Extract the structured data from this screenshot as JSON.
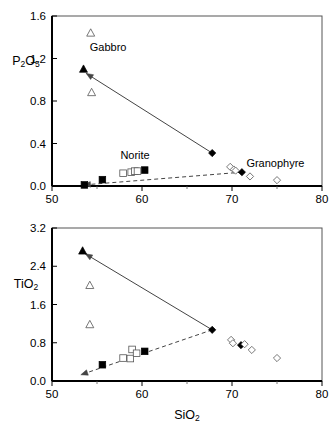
{
  "figure": {
    "panels": [
      {
        "id": "p2o5-vs-sio2",
        "ylabel_main": "P",
        "ylabel_sub1": "2",
        "ylabel_mid": "O",
        "ylabel_sub2": "5",
        "annotations": [
          {
            "text": "Gabbro",
            "x": 54.2,
            "y": 1.27
          },
          {
            "text": "Norite",
            "x": 57.6,
            "y": 0.25
          },
          {
            "text": "Granophyre",
            "x": 71.6,
            "y": 0.175
          }
        ]
      },
      {
        "id": "tio2-vs-sio2",
        "ylabel_main": "TiO",
        "ylabel_sub1": "2",
        "annotations": []
      }
    ],
    "xlabel_main": "SiO",
    "xlabel_sub": "2"
  },
  "chart_data": [
    {
      "type": "scatter",
      "title": "",
      "xlabel": "SiO2",
      "ylabel": "P2O5",
      "xlim": [
        50,
        80
      ],
      "ylim": [
        0.0,
        1.6
      ],
      "xticks": [
        50,
        60,
        70,
        80
      ],
      "xticklabels": [
        "50",
        "60",
        "70",
        "80"
      ],
      "yticks": [
        0.0,
        0.4,
        0.8,
        1.2,
        1.6
      ],
      "yticklabels": [
        "0.0",
        "0.4",
        "0.8",
        "1.2",
        "1.6"
      ],
      "grid": false,
      "legend": "none",
      "annotations": [
        "Gabbro",
        "Norite",
        "Granophyre"
      ],
      "series": [
        {
          "name": "Gabbro (filled triangle)",
          "marker": "triangle-filled",
          "points": [
            [
              53.5,
              1.1
            ]
          ]
        },
        {
          "name": "Gabbro (open triangle)",
          "marker": "triangle-open",
          "points": [
            [
              54.3,
              1.44
            ],
            [
              54.4,
              0.88
            ]
          ]
        },
        {
          "name": "Norite (filled square)",
          "marker": "square-filled",
          "points": [
            [
              53.6,
              0.01
            ],
            [
              55.6,
              0.06
            ],
            [
              60.3,
              0.15
            ]
          ]
        },
        {
          "name": "Norite (open square)",
          "marker": "square-open",
          "points": [
            [
              57.9,
              0.12
            ],
            [
              58.8,
              0.13
            ],
            [
              59.2,
              0.14
            ],
            [
              59.5,
              0.14
            ]
          ]
        },
        {
          "name": "Granophyre (filled diamond)",
          "marker": "diamond-filled",
          "points": [
            [
              67.8,
              0.31
            ],
            [
              71.1,
              0.13
            ]
          ]
        },
        {
          "name": "Granophyre (open diamond)",
          "marker": "diamond-open",
          "points": [
            [
              69.8,
              0.18
            ],
            [
              70.2,
              0.155
            ],
            [
              70.4,
              0.145
            ],
            [
              72.0,
              0.09
            ],
            [
              75.0,
              0.055
            ]
          ]
        }
      ],
      "trends": [
        {
          "name": "solid-arrow-gabbro-to-granophyre",
          "style": "solid",
          "from": [
            67.8,
            0.31
          ],
          "to": [
            53.8,
            1.06
          ],
          "arrow": "to"
        },
        {
          "name": "dashed-arrow-norite",
          "style": "dashed",
          "from": [
            71.1,
            0.13
          ],
          "to": [
            53.5,
            0.01
          ],
          "arrow": "to"
        }
      ]
    },
    {
      "type": "scatter",
      "title": "",
      "xlabel": "SiO2",
      "ylabel": "TiO2",
      "xlim": [
        50,
        80
      ],
      "ylim": [
        0.0,
        3.2
      ],
      "xticks": [
        50,
        60,
        70,
        80
      ],
      "xticklabels": [
        "50",
        "60",
        "70",
        "80"
      ],
      "yticks": [
        0.0,
        0.8,
        1.6,
        2.4,
        3.2
      ],
      "yticklabels": [
        "0.0",
        "0.8",
        "1.6",
        "2.4",
        "3.2"
      ],
      "grid": false,
      "legend": "none",
      "annotations": [],
      "series": [
        {
          "name": "Gabbro (filled triangle)",
          "marker": "triangle-filled",
          "points": [
            [
              53.4,
              2.72
            ]
          ]
        },
        {
          "name": "Gabbro (open triangle)",
          "marker": "triangle-open",
          "points": [
            [
              54.2,
              2.0
            ],
            [
              54.2,
              1.18
            ]
          ]
        },
        {
          "name": "Norite (filled square)",
          "marker": "square-filled",
          "points": [
            [
              55.6,
              0.34
            ],
            [
              60.3,
              0.62
            ]
          ]
        },
        {
          "name": "Norite (open square)",
          "marker": "square-open",
          "points": [
            [
              57.9,
              0.48
            ],
            [
              58.7,
              0.47
            ],
            [
              58.9,
              0.66
            ],
            [
              59.4,
              0.58
            ]
          ]
        },
        {
          "name": "Granophyre (filled diamond)",
          "marker": "diamond-filled",
          "points": [
            [
              67.8,
              1.07
            ],
            [
              71.0,
              0.75
            ]
          ]
        },
        {
          "name": "Granophyre (open diamond)",
          "marker": "diamond-open",
          "points": [
            [
              69.9,
              0.86
            ],
            [
              70.1,
              0.79
            ],
            [
              71.4,
              0.77
            ],
            [
              72.2,
              0.65
            ],
            [
              75.0,
              0.48
            ]
          ]
        }
      ],
      "trends": [
        {
          "name": "solid-arrow-granophyre-to-gabbro",
          "style": "solid",
          "from": [
            67.8,
            1.07
          ],
          "to": [
            53.7,
            2.66
          ],
          "arrow": "to"
        },
        {
          "name": "dashed-arrow-norite",
          "style": "dashed",
          "from": [
            67.8,
            1.07
          ],
          "to": [
            53.2,
            0.13
          ],
          "arrow": "to"
        }
      ]
    }
  ]
}
